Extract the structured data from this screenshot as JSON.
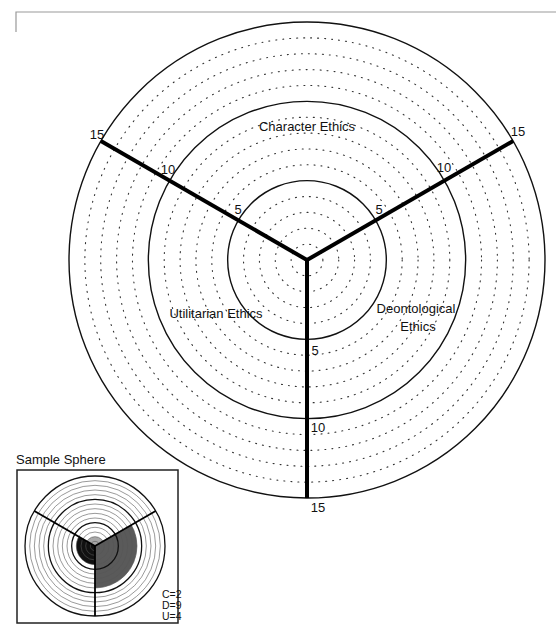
{
  "diagram": {
    "axes": [
      {
        "name": "Character Ethics",
        "label": "Character Ethics",
        "angle_deg": -30
      },
      {
        "name": "Deontological Ethics",
        "label_line1": "Deontological",
        "label_line2": "Ethics",
        "angle_deg": 90
      },
      {
        "name": "Utilitarian Ethics",
        "label": "Utilitarian Ethics",
        "angle_deg": 210
      }
    ],
    "labels": {
      "character": "Character Ethics",
      "deontological_1": "Deontological",
      "deontological_2": "Ethics",
      "utilitarian": "Utilitarian Ethics"
    },
    "ticks": {
      "left_5": "5",
      "left_10": "10",
      "left_15": "15",
      "right_5": "5",
      "right_10": "10",
      "right_15": "15",
      "bottom_5": "5",
      "bottom_10": "10",
      "bottom_15": "15"
    },
    "scale_max": 15,
    "major_rings": [
      5,
      10,
      15
    ]
  },
  "sample": {
    "title": "Sample Sphere",
    "c_label": "C=2",
    "d_label": "D=9",
    "u_label": "U=4",
    "values": {
      "C": 2,
      "D": 9,
      "U": 4
    },
    "colors": {
      "C": "#a8a8a8",
      "D": "#5a5a5a",
      "U": "#111111"
    }
  }
}
